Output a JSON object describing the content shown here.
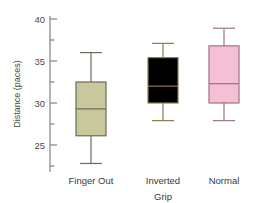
{
  "chart_data": {
    "type": "box",
    "title": "",
    "subtitle": "",
    "xlabel": "",
    "ylabel": "Distance (paces)",
    "ylim": [
      22,
      40.5
    ],
    "grid": false,
    "legend": "none",
    "y_ticks_major": [
      25,
      30,
      35,
      40
    ],
    "y_ticks_minor": [
      22.5,
      27.5,
      32.5,
      37.5
    ],
    "categories": [
      "Finger Out",
      "Inverted Grip",
      "Normal"
    ],
    "category_lines": [
      [
        "Finger Out"
      ],
      [
        "Inverted",
        "Grip"
      ],
      [
        "Normal"
      ]
    ],
    "boxes": [
      {
        "name": "Finger Out",
        "min": 22.8,
        "q1": 26.1,
        "median": 29.3,
        "q3": 32.5,
        "max": 36.0,
        "fill": "#c8c89c",
        "stroke": "#6b6b5a"
      },
      {
        "name": "Inverted Grip",
        "min": 27.9,
        "q1": 30.0,
        "median": 32.0,
        "q3": 35.4,
        "max": 37.1,
        "fill": "#efc храм",
        "stroke": "#8a7a52"
      },
      {
        "name": "Normal",
        "min": 27.9,
        "q1": 30.0,
        "median": 32.3,
        "q3": 36.8,
        "max": 38.9,
        "fill": "#f5c0d3",
        "stroke": "#9a7385"
      }
    ],
    "colors": {
      "axis": "#8a8a8a",
      "text": "#4a4a4a",
      "background": "#ffffff"
    }
  }
}
